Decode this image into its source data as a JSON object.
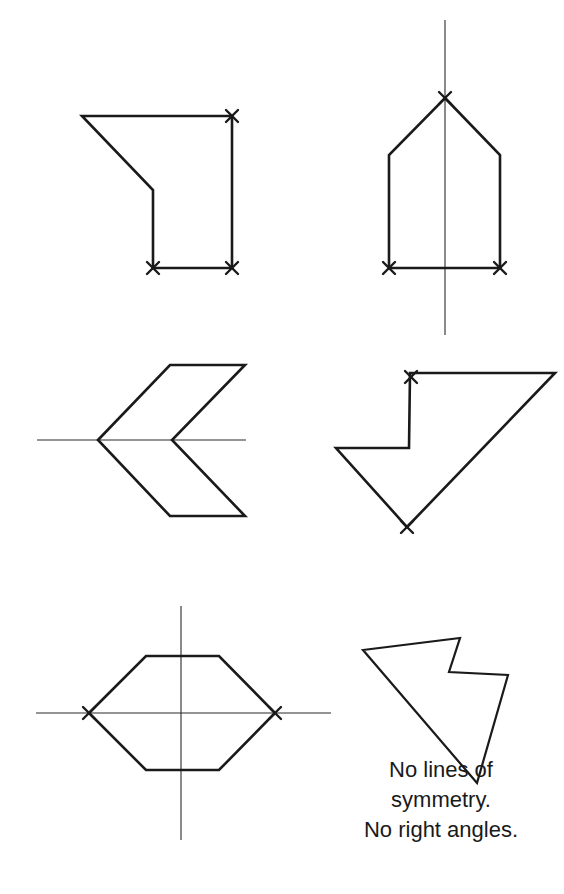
{
  "figure": {
    "colors": {
      "stroke": "#1a1a1a",
      "background": "#ffffff"
    },
    "shapes": [
      {
        "id": "shape-1",
        "position": "top-left",
        "type": "irregular pentagon",
        "lines_of_symmetry": 0,
        "right_angle_marks": 3
      },
      {
        "id": "shape-2",
        "position": "top-right",
        "type": "pentagon (house shape)",
        "lines_of_symmetry": 1,
        "symmetry_axis": "vertical",
        "right_angle_marks": 3
      },
      {
        "id": "shape-3",
        "position": "middle-left",
        "type": "chevron hexagon",
        "lines_of_symmetry": 1,
        "symmetry_axis": "horizontal",
        "right_angle_marks": 0
      },
      {
        "id": "shape-4",
        "position": "middle-right",
        "type": "irregular pentagon",
        "lines_of_symmetry": 0,
        "right_angle_marks": 2
      },
      {
        "id": "shape-5",
        "position": "bottom-left",
        "type": "hexagon",
        "lines_of_symmetry": 2,
        "symmetry_axis": "horizontal and vertical",
        "right_angle_marks": 2
      },
      {
        "id": "shape-6",
        "position": "bottom-right",
        "type": "irregular pentagon",
        "lines_of_symmetry": 0,
        "right_angle_marks": 0
      }
    ],
    "caption": {
      "line1": "No lines of",
      "line2": "symmetry.",
      "line3": "No right angles."
    }
  }
}
